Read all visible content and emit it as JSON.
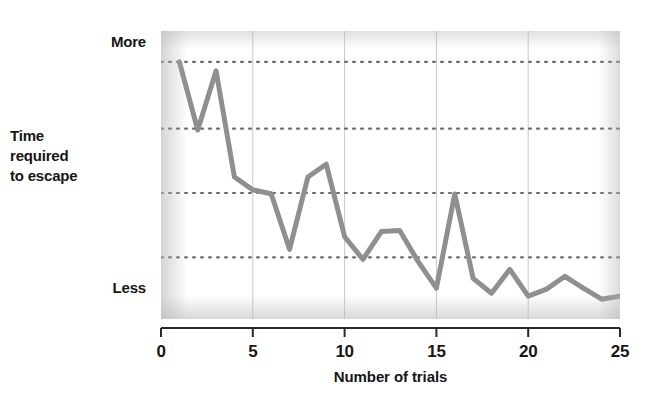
{
  "chart_data": {
    "type": "line",
    "title": "",
    "subtitle": "",
    "xlabel": "Number of trials",
    "ylabel": "Time required to escape",
    "y_top_label": "More",
    "y_bottom_label": "Less",
    "x_tick_labels": [
      "0",
      "5",
      "10",
      "15",
      "20",
      "25"
    ],
    "x_ticks": [
      0,
      5,
      10,
      15,
      20,
      25
    ],
    "xlim": [
      0,
      25
    ],
    "ylim": [
      0,
      1.12
    ],
    "y_tick_labels": [],
    "grid": {
      "horizontal": true,
      "horizontal_style": "dotted",
      "horizontal_values": [
        1.0,
        0.74,
        0.49,
        0.24
      ],
      "vertical": true,
      "vertical_style": "solid-faint",
      "vertical_values": [
        5,
        10,
        15,
        20
      ]
    },
    "legend": {
      "visible": false,
      "position": "none"
    },
    "series": [
      {
        "name": "Time required to escape",
        "color": "#8f8f8f",
        "line_width": 5,
        "x": [
          1,
          2,
          3,
          4,
          5,
          6,
          7,
          8,
          9,
          10,
          11,
          12,
          13,
          14,
          15,
          16,
          17,
          18,
          19,
          20,
          21,
          22,
          23,
          24,
          25
        ],
        "values": [
          1.0,
          0.735,
          0.965,
          0.552,
          0.502,
          0.487,
          0.271,
          0.552,
          0.602,
          0.32,
          0.232,
          0.34,
          0.344,
          0.224,
          0.12,
          0.486,
          0.158,
          0.1,
          0.193,
          0.089,
          0.116,
          0.166,
          0.12,
          0.077,
          0.089
        ]
      }
    ],
    "annotations": []
  },
  "axis": {
    "y_top_label": "More",
    "y_title": "Time\nrequired\nto escape",
    "y_bottom_label": "Less",
    "x_title": "Number of trials",
    "x_labels": [
      "0",
      "5",
      "10",
      "15",
      "20",
      "25"
    ]
  },
  "colors": {
    "line": "#8f8f8f",
    "grid_dotted": "#6f6f6f",
    "grid_vertical": "#c9c9c9",
    "axis": "#2a2a2a",
    "text": "#161616",
    "background": "#ffffff"
  }
}
